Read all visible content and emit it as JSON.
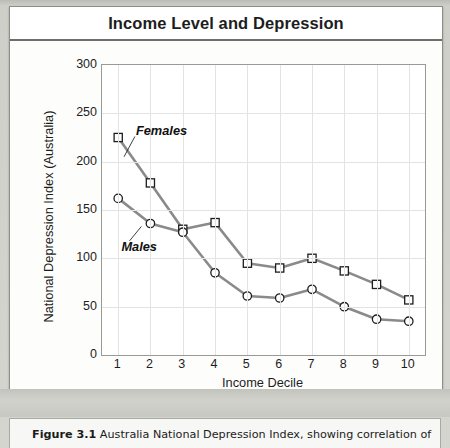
{
  "figure": {
    "title": "Income Level and Depression",
    "credit": "© Infobase Publishing",
    "caption_label": "Figure 3.1",
    "caption_text": "Australia National Depression Index, showing correlation of"
  },
  "chart_data": {
    "type": "line",
    "title": "Income Level and Depression",
    "xlabel": "Income Decile",
    "xlabel_note": "(10 = highest income)",
    "ylabel": "National Depression Index (Australia)",
    "categories": [
      "1",
      "2",
      "3",
      "4",
      "5",
      "6",
      "7",
      "8",
      "9",
      "10"
    ],
    "x": [
      1,
      2,
      3,
      4,
      5,
      6,
      7,
      8,
      9,
      10
    ],
    "xlim": [
      0.5,
      10.5
    ],
    "ylim": [
      0,
      300
    ],
    "yticks": [
      "300",
      "250",
      "200",
      "150",
      "100",
      "50",
      "0"
    ],
    "ytick_values": [
      300,
      250,
      200,
      150,
      100,
      50,
      0
    ],
    "grid": true,
    "legend": "inline-annotations",
    "series": [
      {
        "name": "Females",
        "marker": "square",
        "values": [
          225,
          178,
          130,
          137,
          95,
          90,
          100,
          87,
          73,
          57
        ]
      },
      {
        "name": "Males",
        "marker": "circle",
        "values": [
          162,
          136,
          127,
          85,
          61,
          59,
          68,
          50,
          37,
          35
        ]
      }
    ],
    "annotations": [
      {
        "text": "Females",
        "x": 1.55,
        "y": 232
      },
      {
        "text": "Males",
        "x": 1.1,
        "y": 112
      }
    ],
    "colors": {
      "line": "#8a8a8a",
      "marker_stroke": "#1d1d1d",
      "marker_fill": "#ffffff",
      "grid": "#e3e3e1",
      "axis": "#9a9a95",
      "text": "#1d1d1d"
    }
  }
}
